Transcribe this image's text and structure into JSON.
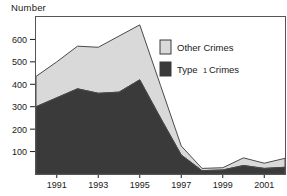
{
  "chart_data": {
    "type": "area",
    "title": "",
    "ylabel": "Number",
    "xlabel": "",
    "stacked": true,
    "grid": false,
    "legend_position": "inside-top-right",
    "ylim": [
      0,
      700
    ],
    "xlim": [
      1990,
      2002
    ],
    "yticks": [
      100,
      200,
      300,
      400,
      500,
      600
    ],
    "ytick_labels": [
      "100",
      "200",
      "300",
      "400",
      "500",
      "600"
    ],
    "x": [
      1990,
      1991,
      1992,
      1993,
      1994,
      1995,
      1996,
      1997,
      1998,
      1999,
      2000,
      2001,
      2002
    ],
    "xtick_labels": [
      "1991",
      "1993",
      "1995",
      "1997",
      "1999",
      "2001"
    ],
    "xticks": [
      1991,
      1993,
      1995,
      1997,
      1999,
      2001
    ],
    "series": [
      {
        "name": "Type 1 Crimes",
        "color": "#3a3a3a",
        "values": [
          300,
          340,
          380,
          360,
          365,
          420,
          250,
          85,
          15,
          18,
          38,
          25,
          30
        ]
      },
      {
        "name": "Other Crimes",
        "color": "#d9d9d9",
        "values": [
          135,
          160,
          190,
          205,
          250,
          245,
          145,
          40,
          10,
          10,
          34,
          23,
          40
        ]
      }
    ],
    "totals": [
      435,
      500,
      570,
      565,
      615,
      665,
      395,
      125,
      25,
      28,
      72,
      48,
      70
    ]
  },
  "legend": {
    "items": [
      {
        "label": "Other Crimes",
        "label_main": "Other Crimes",
        "color": "#d9d9d9"
      },
      {
        "label": "Type 1 Crimes",
        "label_prefix": "Type",
        "label_num": "1",
        "label_suffix": "Crimes",
        "color": "#3a3a3a"
      }
    ]
  },
  "axis": {
    "y_title": "Number"
  }
}
